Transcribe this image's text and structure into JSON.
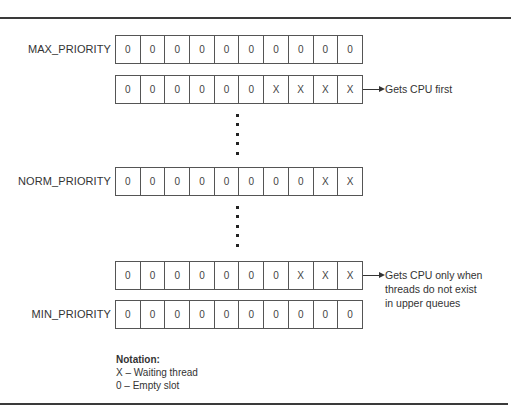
{
  "diagram": {
    "queues": [
      {
        "label": "MAX_PRIORITY",
        "slots": [
          "0",
          "0",
          "0",
          "0",
          "0",
          "0",
          "0",
          "0",
          "0",
          "0"
        ],
        "annotation": []
      },
      {
        "label": "",
        "slots": [
          "0",
          "0",
          "0",
          "0",
          "0",
          "0",
          "X",
          "X",
          "X",
          "X"
        ],
        "annotation": [
          "Gets CPU first"
        ]
      },
      {
        "label": "NORM_PRIORITY",
        "slots": [
          "0",
          "0",
          "0",
          "0",
          "0",
          "0",
          "0",
          "0",
          "X",
          "X"
        ],
        "annotation": []
      },
      {
        "label": "",
        "slots": [
          "0",
          "0",
          "0",
          "0",
          "0",
          "0",
          "0",
          "X",
          "X",
          "X"
        ],
        "annotation": [
          "Gets CPU only when",
          "threads do not exist",
          "in upper queues"
        ]
      },
      {
        "label": "MIN_PRIORITY",
        "slots": [
          "0",
          "0",
          "0",
          "0",
          "0",
          "0",
          "0",
          "0",
          "0",
          "0"
        ],
        "annotation": []
      }
    ],
    "ellipsis_glyph": "•",
    "notation": {
      "title": "Notation:",
      "items": [
        "X – Waiting thread",
        "0 – Empty slot"
      ]
    }
  }
}
